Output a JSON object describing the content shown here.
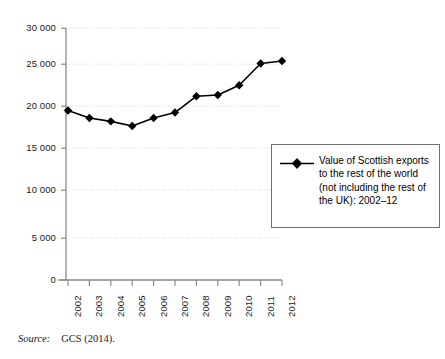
{
  "chart_data": {
    "type": "line",
    "title": "",
    "subtitle": "",
    "xlabel": "",
    "ylabel": "",
    "categories": [
      "2002",
      "2003",
      "2004",
      "2005",
      "2006",
      "2007",
      "2008",
      "2009",
      "2010",
      "2011",
      "2012"
    ],
    "series": [
      {
        "name": "Value of Scottish exports to the rest of the world (not including the rest of the UK): 2002–12",
        "values": [
          20200,
          19300,
          18900,
          18350,
          19300,
          19950,
          21900,
          22050,
          23200,
          25800,
          26100
        ],
        "color": "#000000",
        "marker": "diamond"
      }
    ],
    "ylim": [
      0,
      30000
    ],
    "yticks": [
      0,
      5000,
      10000,
      15000,
      20000,
      25000,
      30000
    ],
    "ytick_labels": [
      "0",
      "5 000",
      "10 000",
      "15 000",
      "20 000",
      "25 000",
      "30 000"
    ],
    "xtick_labels": [
      "2002",
      "2003",
      "2004",
      "2005",
      "2006",
      "2007",
      "2008",
      "2009",
      "2010",
      "2011",
      "2012"
    ],
    "xtick_rotation": 90,
    "grid": true,
    "grid_axis": "y",
    "grid_style": "dotted",
    "grid_color": "#d8d8d8",
    "legend_position": "center right",
    "axis_color": "#8a8a8a",
    "line_color": "#000000",
    "marker_color": "#000000"
  },
  "legend": {
    "entries": [
      {
        "marker_name": "diamond-marker",
        "label": "Value of Scottish exports to the rest of the world (not including the rest of the UK): 2002–12"
      }
    ]
  },
  "source": {
    "label": "Source:",
    "value": "GCS (2014)."
  }
}
